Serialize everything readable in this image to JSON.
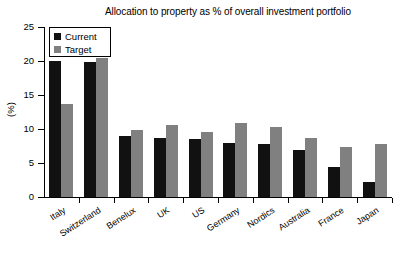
{
  "chart_data": {
    "type": "bar",
    "title": "Allocation to property as % of overall investment portfolio",
    "xlabel": "",
    "ylabel": "(%)",
    "ylim": [
      0,
      25
    ],
    "yticks": [
      0,
      5,
      10,
      15,
      20,
      25
    ],
    "grid": false,
    "legend_position": "top-left",
    "categories": [
      "Italy",
      "Switzerland",
      "Benelux",
      "UK",
      "US",
      "Germany",
      "Nordics",
      "Australia",
      "France",
      "Japan"
    ],
    "series": [
      {
        "name": "Current",
        "color": "#111111",
        "values": [
          20.0,
          19.8,
          9.0,
          8.7,
          8.5,
          7.9,
          7.8,
          6.9,
          4.4,
          2.2
        ]
      },
      {
        "name": "Target",
        "color": "#808080",
        "values": [
          13.7,
          20.4,
          9.9,
          10.6,
          9.6,
          10.9,
          10.3,
          8.7,
          7.3,
          7.8
        ]
      }
    ]
  },
  "legend": {
    "items": [
      {
        "label": "Current",
        "swatch": "black-square-icon"
      },
      {
        "label": "Target",
        "swatch": "gray-square-icon"
      }
    ]
  }
}
